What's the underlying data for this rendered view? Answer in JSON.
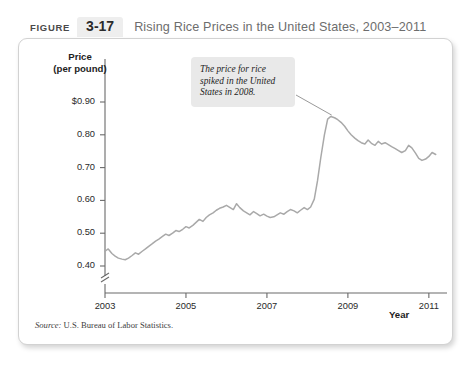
{
  "header": {
    "figure_word": "FIGURE",
    "figure_number": "3-17",
    "title": "Rising Rice Prices in the United States, 2003–2011"
  },
  "annotation": {
    "text": "The price for rice spiked in the United States in 2008."
  },
  "source": {
    "prefix": "Source:",
    "text": "U.S. Bureau of Labor Statistics."
  },
  "chart_data": {
    "type": "line",
    "title": "Rising Rice Prices in the United States, 2003–2011",
    "xlabel": "Year",
    "ylabel": "Price (per pound)",
    "ylim": [
      0.35,
      0.93
    ],
    "xlim": [
      2003,
      2011.3
    ],
    "grid": false,
    "legend": "none",
    "axis_break_y": true,
    "y_ticks": [
      "$0.90",
      "0.80",
      "0.70",
      "0.60",
      "0.50",
      "0.40"
    ],
    "y_tick_values": [
      0.9,
      0.8,
      0.7,
      0.6,
      0.5,
      0.4
    ],
    "x_ticks": [
      "2003",
      "2005",
      "2007",
      "2009",
      "2011"
    ],
    "x_tick_values": [
      2003,
      2005,
      2007,
      2009,
      2011
    ],
    "line_color": "#a9a9a9",
    "annotations": [
      {
        "text": "The price for rice spiked in the United States in 2008.",
        "point_x": 2008.6,
        "point_y": 0.86
      }
    ],
    "series": [
      {
        "name": "Rice price per pound",
        "x": [
          2003.0,
          2003.08,
          2003.17,
          2003.25,
          2003.33,
          2003.42,
          2003.5,
          2003.58,
          2003.67,
          2003.75,
          2003.83,
          2003.92,
          2004.0,
          2004.08,
          2004.17,
          2004.25,
          2004.33,
          2004.42,
          2004.5,
          2004.58,
          2004.67,
          2004.75,
          2004.83,
          2004.92,
          2005.0,
          2005.08,
          2005.17,
          2005.25,
          2005.33,
          2005.42,
          2005.5,
          2005.58,
          2005.67,
          2005.75,
          2005.83,
          2005.92,
          2006.0,
          2006.08,
          2006.17,
          2006.25,
          2006.33,
          2006.42,
          2006.5,
          2006.58,
          2006.67,
          2006.75,
          2006.83,
          2006.92,
          2007.0,
          2007.08,
          2007.17,
          2007.25,
          2007.33,
          2007.42,
          2007.5,
          2007.58,
          2007.67,
          2007.75,
          2007.83,
          2007.92,
          2008.0,
          2008.08,
          2008.17,
          2008.25,
          2008.33,
          2008.42,
          2008.5,
          2008.58,
          2008.67,
          2008.75,
          2008.83,
          2008.92,
          2009.0,
          2009.08,
          2009.17,
          2009.25,
          2009.33,
          2009.42,
          2009.5,
          2009.58,
          2009.67,
          2009.75,
          2009.83,
          2009.92,
          2010.0,
          2010.08,
          2010.17,
          2010.25,
          2010.33,
          2010.42,
          2010.5,
          2010.58,
          2010.67,
          2010.75,
          2010.83,
          2010.92,
          2011.0,
          2011.08,
          2011.17
        ],
        "values": [
          0.445,
          0.452,
          0.438,
          0.43,
          0.424,
          0.421,
          0.419,
          0.424,
          0.432,
          0.44,
          0.436,
          0.445,
          0.452,
          0.46,
          0.468,
          0.476,
          0.482,
          0.49,
          0.497,
          0.493,
          0.5,
          0.508,
          0.505,
          0.512,
          0.52,
          0.516,
          0.524,
          0.533,
          0.542,
          0.536,
          0.548,
          0.556,
          0.562,
          0.57,
          0.576,
          0.58,
          0.585,
          0.579,
          0.572,
          0.59,
          0.578,
          0.568,
          0.562,
          0.556,
          0.566,
          0.56,
          0.553,
          0.558,
          0.552,
          0.548,
          0.55,
          0.556,
          0.562,
          0.558,
          0.566,
          0.572,
          0.568,
          0.562,
          0.57,
          0.578,
          0.572,
          0.58,
          0.604,
          0.66,
          0.73,
          0.8,
          0.848,
          0.856,
          0.852,
          0.846,
          0.838,
          0.826,
          0.812,
          0.8,
          0.79,
          0.782,
          0.776,
          0.772,
          0.784,
          0.774,
          0.768,
          0.78,
          0.772,
          0.776,
          0.77,
          0.764,
          0.758,
          0.752,
          0.746,
          0.752,
          0.768,
          0.76,
          0.744,
          0.728,
          0.722,
          0.726,
          0.734,
          0.746,
          0.74
        ]
      }
    ]
  }
}
